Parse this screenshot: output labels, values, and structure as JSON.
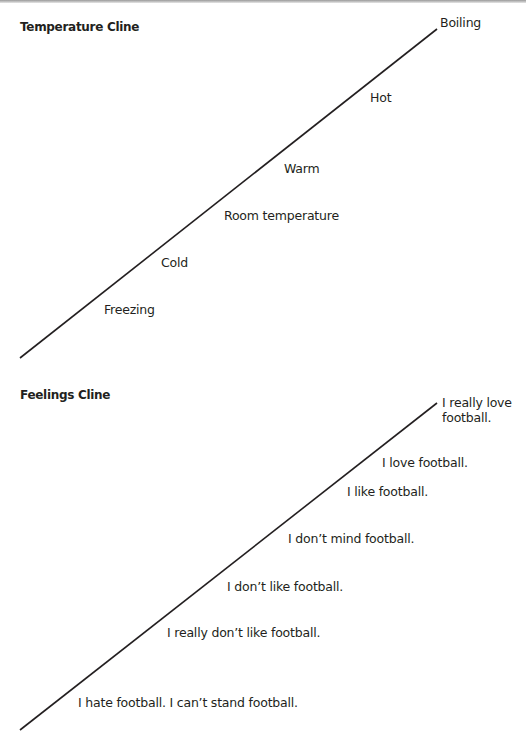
{
  "temperature_cline": {
    "title": "Temperature Cline",
    "line": {
      "x1": 20,
      "y1": 358,
      "x2": 437,
      "y2": 29
    },
    "labels": [
      {
        "text": "Boiling",
        "x": 440,
        "y": 22
      },
      {
        "text": "Hot",
        "x": 370,
        "y": 97
      },
      {
        "text": "Warm",
        "x": 284,
        "y": 168
      },
      {
        "text": "Room temperature",
        "x": 224,
        "y": 215
      },
      {
        "text": "Cold",
        "x": 161,
        "y": 262
      },
      {
        "text": "Freezing",
        "x": 104,
        "y": 309
      }
    ]
  },
  "feelings_cline": {
    "title": "Feelings Cline",
    "line": {
      "x1": 20,
      "y1": 730,
      "x2": 437,
      "y2": 403
    },
    "labels": [
      {
        "text": "I really love football.",
        "x": 442,
        "y": 405
      },
      {
        "text": "I love football.",
        "x": 382,
        "y": 462
      },
      {
        "text": "I like football.",
        "x": 347,
        "y": 491
      },
      {
        "text": "I don’t mind football.",
        "x": 288,
        "y": 538
      },
      {
        "text": "I don’t like football.",
        "x": 227,
        "y": 586
      },
      {
        "text": "I really don’t like football.",
        "x": 167,
        "y": 632
      },
      {
        "text": "I hate football. I can’t stand football.",
        "x": 78,
        "y": 702
      }
    ]
  }
}
